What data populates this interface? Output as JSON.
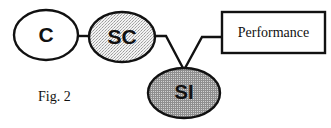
{
  "figure": {
    "caption": "Fig. 2",
    "background_color": "#ffffff",
    "stroke_color": "#111111"
  },
  "nodes": {
    "c": {
      "label": "C",
      "shape": "ellipse",
      "fill": "white",
      "fill_color": "#ffffff",
      "cx": 46,
      "cy": 35,
      "rx": 32,
      "ry": 25
    },
    "sc": {
      "label": "SC",
      "shape": "ellipse",
      "fill": "light-stipple",
      "fill_color": "#e8e8e8",
      "cx": 122,
      "cy": 37,
      "rx": 33,
      "ry": 25
    },
    "si": {
      "label": "SI",
      "shape": "ellipse",
      "fill": "dark-crosshatch",
      "fill_color": "#a8a8a8",
      "cx": 184,
      "cy": 93,
      "rx": 36,
      "ry": 25
    },
    "performance": {
      "label": "Performance",
      "shape": "rectangle",
      "fill": "white",
      "fill_color": "#ffffff",
      "x": 222,
      "y": 12,
      "width": 103,
      "height": 41
    }
  },
  "connectors": [
    {
      "name": "c-to-sc",
      "from": "c",
      "to": "sc",
      "style": "straight-horizontal"
    },
    {
      "name": "sc-to-si",
      "from": "sc",
      "to": "si",
      "style": "elbow-diagonal"
    },
    {
      "name": "performance-to-si",
      "from": "performance",
      "to": "si",
      "style": "elbow-diagonal"
    }
  ]
}
